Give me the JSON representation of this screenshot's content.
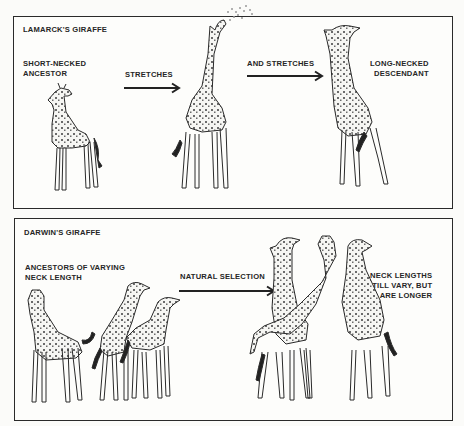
{
  "figure": {
    "panels": [
      {
        "id": "lamarck",
        "title": "LAMARCK'S GIRAFFE",
        "stages": [
          {
            "label_lines": [
              "SHORT-NECKED",
              "ANCESTOR"
            ],
            "depiction": "short-necked giraffe standing"
          },
          {
            "arrow_label": "STRETCHES",
            "depiction": "giraffe stretching neck up to reach leaves"
          },
          {
            "arrow_label": "AND STRETCHES"
          },
          {
            "label_lines": [
              "LONG-NECKED",
              "DESCENDANT"
            ],
            "depiction": "long-necked giraffe"
          }
        ]
      },
      {
        "id": "darwin",
        "title": "DARWIN'S GIRAFFE",
        "stages": [
          {
            "label_lines": [
              "ANCESTORS OF VARYING",
              "NECK LENGTH"
            ],
            "depiction": "three giraffes with short and medium necks"
          },
          {
            "arrow_label": "NATURAL SELECTION"
          },
          {
            "label_lines": [
              "NECK LENGTHS",
              "STILL VARY, BUT",
              "ARE LONGER"
            ],
            "depiction": "three giraffes with long necks"
          }
        ]
      }
    ],
    "colors": {
      "ink": "#262626",
      "background": "#fbfbf9",
      "spots": "#6a6a6a"
    }
  }
}
